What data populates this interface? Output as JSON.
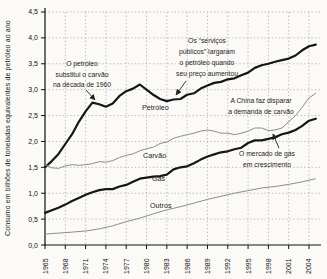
{
  "chart_data": {
    "type": "line",
    "title": "",
    "xlabel": "",
    "ylabel": "Consumo em bilhões de toneladas equivalentes de petróleo ao ano",
    "ylim": [
      0,
      4.5
    ],
    "xlim": [
      1965,
      2005.4
    ],
    "grid": "dotted",
    "legend_position": "inline-labels",
    "y_ticks": [
      "0,0",
      "0,5",
      "1,0",
      "1,5",
      "2,0",
      "2,5",
      "3,0",
      "3,5",
      "4,0",
      "4,5"
    ],
    "x_ticks": [
      1965,
      1968,
      1971,
      1974,
      1977,
      1980,
      1983,
      1986,
      1989,
      1992,
      1995,
      1998,
      2001,
      2004
    ],
    "line_color_thick": "#161616",
    "line_color_thin": "#8d8d8d",
    "series": [
      {
        "name": "Petróleo",
        "slug": "petroleo",
        "style": "thick",
        "label_pos": [
          142,
          110
        ],
        "points": [
          [
            1965,
            1.5
          ],
          [
            1966,
            1.62
          ],
          [
            1967,
            1.76
          ],
          [
            1968,
            1.95
          ],
          [
            1969,
            2.14
          ],
          [
            1970,
            2.38
          ],
          [
            1971,
            2.58
          ],
          [
            1972,
            2.75
          ],
          [
            1973,
            2.72
          ],
          [
            1974,
            2.67
          ],
          [
            1975,
            2.73
          ],
          [
            1976,
            2.88
          ],
          [
            1977,
            2.97
          ],
          [
            1978,
            3.02
          ],
          [
            1979,
            3.1
          ],
          [
            1980,
            3.0
          ],
          [
            1981,
            2.9
          ],
          [
            1982,
            2.82
          ],
          [
            1983,
            2.78
          ],
          [
            1984,
            2.81
          ],
          [
            1985,
            2.82
          ],
          [
            1986,
            2.9
          ],
          [
            1987,
            2.93
          ],
          [
            1988,
            3.02
          ],
          [
            1989,
            3.08
          ],
          [
            1990,
            3.13
          ],
          [
            1991,
            3.15
          ],
          [
            1992,
            3.2
          ],
          [
            1993,
            3.22
          ],
          [
            1994,
            3.28
          ],
          [
            1995,
            3.33
          ],
          [
            1996,
            3.42
          ],
          [
            1997,
            3.47
          ],
          [
            1998,
            3.5
          ],
          [
            1999,
            3.54
          ],
          [
            2000,
            3.57
          ],
          [
            2001,
            3.6
          ],
          [
            2002,
            3.66
          ],
          [
            2003,
            3.76
          ],
          [
            2004,
            3.84
          ],
          [
            2005,
            3.87
          ]
        ]
      },
      {
        "name": "Carvão",
        "slug": "carvao",
        "style": "thin",
        "label_pos": [
          143,
          158
        ],
        "points": [
          [
            1965,
            1.55
          ],
          [
            1966,
            1.49
          ],
          [
            1967,
            1.48
          ],
          [
            1968,
            1.53
          ],
          [
            1969,
            1.55
          ],
          [
            1970,
            1.54
          ],
          [
            1971,
            1.55
          ],
          [
            1972,
            1.57
          ],
          [
            1973,
            1.61
          ],
          [
            1974,
            1.6
          ],
          [
            1975,
            1.63
          ],
          [
            1976,
            1.69
          ],
          [
            1977,
            1.73
          ],
          [
            1978,
            1.76
          ],
          [
            1979,
            1.82
          ],
          [
            1980,
            1.86
          ],
          [
            1981,
            1.89
          ],
          [
            1982,
            1.96
          ],
          [
            1983,
            1.99
          ],
          [
            1984,
            2.06
          ],
          [
            1985,
            2.1
          ],
          [
            1986,
            2.13
          ],
          [
            1987,
            2.16
          ],
          [
            1988,
            2.2
          ],
          [
            1989,
            2.22
          ],
          [
            1990,
            2.2
          ],
          [
            1991,
            2.16
          ],
          [
            1992,
            2.16
          ],
          [
            1993,
            2.13
          ],
          [
            1994,
            2.16
          ],
          [
            1995,
            2.2
          ],
          [
            1996,
            2.26
          ],
          [
            1997,
            2.26
          ],
          [
            1998,
            2.21
          ],
          [
            1999,
            2.22
          ],
          [
            2000,
            2.26
          ],
          [
            2001,
            2.38
          ],
          [
            2002,
            2.5
          ],
          [
            2003,
            2.66
          ],
          [
            2004,
            2.84
          ],
          [
            2005,
            2.93
          ]
        ]
      },
      {
        "name": "Gás",
        "slug": "gas",
        "style": "thick",
        "label_pos": [
          152,
          181
        ],
        "points": [
          [
            1965,
            0.62
          ],
          [
            1966,
            0.67
          ],
          [
            1967,
            0.72
          ],
          [
            1968,
            0.78
          ],
          [
            1969,
            0.85
          ],
          [
            1970,
            0.91
          ],
          [
            1971,
            0.97
          ],
          [
            1972,
            1.02
          ],
          [
            1973,
            1.06
          ],
          [
            1974,
            1.08
          ],
          [
            1975,
            1.08
          ],
          [
            1976,
            1.13
          ],
          [
            1977,
            1.16
          ],
          [
            1978,
            1.22
          ],
          [
            1979,
            1.28
          ],
          [
            1980,
            1.3
          ],
          [
            1981,
            1.32
          ],
          [
            1982,
            1.33
          ],
          [
            1983,
            1.36
          ],
          [
            1984,
            1.46
          ],
          [
            1985,
            1.5
          ],
          [
            1986,
            1.52
          ],
          [
            1987,
            1.58
          ],
          [
            1988,
            1.65
          ],
          [
            1989,
            1.71
          ],
          [
            1990,
            1.75
          ],
          [
            1991,
            1.79
          ],
          [
            1992,
            1.81
          ],
          [
            1993,
            1.85
          ],
          [
            1994,
            1.88
          ],
          [
            1995,
            1.97
          ],
          [
            1996,
            2.02
          ],
          [
            1997,
            2.02
          ],
          [
            1998,
            2.05
          ],
          [
            1999,
            2.08
          ],
          [
            2000,
            2.14
          ],
          [
            2001,
            2.17
          ],
          [
            2002,
            2.22
          ],
          [
            2003,
            2.3
          ],
          [
            2004,
            2.4
          ],
          [
            2005,
            2.44
          ]
        ]
      },
      {
        "name": "Outros",
        "slug": "outros",
        "style": "thin",
        "label_pos": [
          150,
          208
        ],
        "points": [
          [
            1965,
            0.21
          ],
          [
            1967,
            0.23
          ],
          [
            1969,
            0.25
          ],
          [
            1971,
            0.27
          ],
          [
            1973,
            0.31
          ],
          [
            1975,
            0.37
          ],
          [
            1977,
            0.45
          ],
          [
            1979,
            0.52
          ],
          [
            1981,
            0.6
          ],
          [
            1983,
            0.68
          ],
          [
            1985,
            0.74
          ],
          [
            1987,
            0.81
          ],
          [
            1989,
            0.88
          ],
          [
            1991,
            0.94
          ],
          [
            1993,
            1.0
          ],
          [
            1995,
            1.05
          ],
          [
            1997,
            1.1
          ],
          [
            1999,
            1.13
          ],
          [
            2001,
            1.17
          ],
          [
            2003,
            1.22
          ],
          [
            2005,
            1.28
          ]
        ]
      }
    ],
    "annotations": [
      {
        "id": "oil-replaces-coal",
        "lines": [
          "O petróleo",
          "substitui o carvão",
          "na década de 1960"
        ],
        "cx": 82,
        "top": 60,
        "lh": 10.5,
        "arrow": [
          86,
          90,
          95,
          100
        ]
      },
      {
        "id": "utilities-dropped-oil",
        "lines": [
          "Os “serviços",
          "públicos” largaram",
          "o petróleo quando",
          "seu preço aumentou"
        ],
        "cx": 207,
        "top": 37,
        "lh": 11,
        "arrow": [
          186,
          81,
          176,
          95
        ]
      },
      {
        "id": "china-coal-demand",
        "lines": [
          "A China faz disparar",
          "a demanda de carvão"
        ],
        "cx": 261,
        "top": 97,
        "lh": 11,
        "arrow": null
      },
      {
        "id": "gas-market-growing",
        "lines": [
          "O mercado de gás",
          "em crescimento"
        ],
        "cx": 267,
        "top": 150,
        "lh": 11,
        "arrow": [
          279,
          148,
          273,
          134
        ]
      }
    ]
  }
}
